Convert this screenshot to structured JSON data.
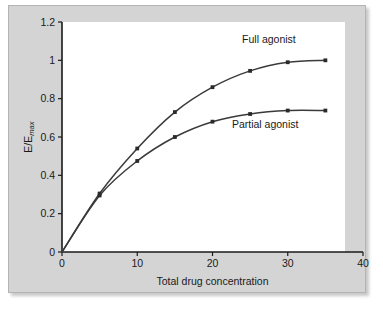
{
  "chart_data": {
    "type": "line",
    "title": "",
    "xlabel": "Total drug concentration",
    "ylabel": "E/E",
    "ylabel_subscript": "max",
    "xlim": [
      0,
      40
    ],
    "ylim": [
      0,
      1.2
    ],
    "grid": false,
    "legend_position": "inline-annotation",
    "xticks": [
      "0",
      "10",
      "20",
      "30",
      "40"
    ],
    "xtick_values": [
      0,
      10,
      20,
      30,
      40
    ],
    "yticks": [
      "0",
      "0.2",
      "0.4",
      "0.6",
      "0.8",
      "1",
      "1.2"
    ],
    "ytick_values": [
      0,
      0.2,
      0.4,
      0.6,
      0.8,
      1,
      1.2
    ],
    "x": [
      0,
      5,
      10,
      15,
      20,
      25,
      30,
      35
    ],
    "series": [
      {
        "name": "Full agonist",
        "values": [
          0,
          0.305,
          0.54,
          0.73,
          0.86,
          0.945,
          0.99,
          1.0
        ],
        "color": "#3a3a3a",
        "label_x": 27.5,
        "label_y": 1.09
      },
      {
        "name": "Partial agonist",
        "values": [
          0,
          0.295,
          0.475,
          0.6,
          0.68,
          0.72,
          0.738,
          0.738
        ],
        "color": "#3a3a3a",
        "label_x": 27.0,
        "label_y": 0.645
      }
    ],
    "annotations": [
      {
        "text": "Full agonist",
        "x": 27.5,
        "y": 1.09
      },
      {
        "text": "Partial agonist",
        "x": 27.0,
        "y": 0.645
      }
    ]
  },
  "colors": {
    "panel_background": "#d4d4d4",
    "plot_background": "#ffffff",
    "axis": "#1a1a1a",
    "curve": "#3a3a3a",
    "marker": "#2a2a2a"
  }
}
